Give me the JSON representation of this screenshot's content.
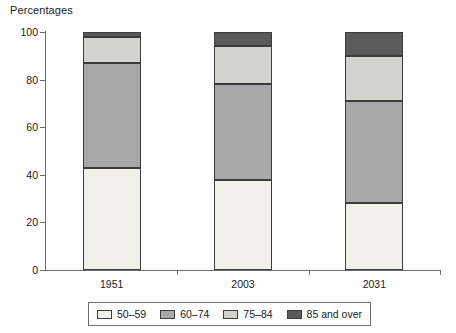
{
  "chart_data": {
    "type": "bar",
    "subtype": "stacked-bar-100",
    "title": "Percentages",
    "xlabel": "",
    "ylabel": "",
    "ylim": [
      0,
      100
    ],
    "yticks": [
      0,
      20,
      40,
      60,
      80,
      100
    ],
    "grid": false,
    "legend_position": "bottom",
    "categories": [
      "1951",
      "2003",
      "2031"
    ],
    "series": [
      {
        "name": "50–59",
        "color": "#f1f0ea",
        "values": [
          43,
          38,
          28
        ]
      },
      {
        "name": "60–74",
        "color": "#a8a8a8",
        "values": [
          44,
          40,
          43
        ]
      },
      {
        "name": "75–84",
        "color": "#d3d3d0",
        "values": [
          11,
          16,
          19
        ]
      },
      {
        "name": "85 and over",
        "color": "#5a5a5a",
        "values": [
          2,
          6,
          10
        ]
      }
    ]
  },
  "axis": {
    "y_tick_labels": [
      "0",
      "20",
      "40",
      "60",
      "80",
      "100"
    ],
    "x_tick_labels": [
      "1951",
      "2003",
      "2031"
    ]
  },
  "legend": {
    "items": [
      {
        "label": "50–59"
      },
      {
        "label": "60–74"
      },
      {
        "label": "75–84"
      },
      {
        "label": "85 and over"
      }
    ]
  },
  "colors": {
    "axis": "#6e6e6e",
    "segment_border": "#3c3c3c",
    "text": "#1a1a1a",
    "background": "#ffffff"
  }
}
